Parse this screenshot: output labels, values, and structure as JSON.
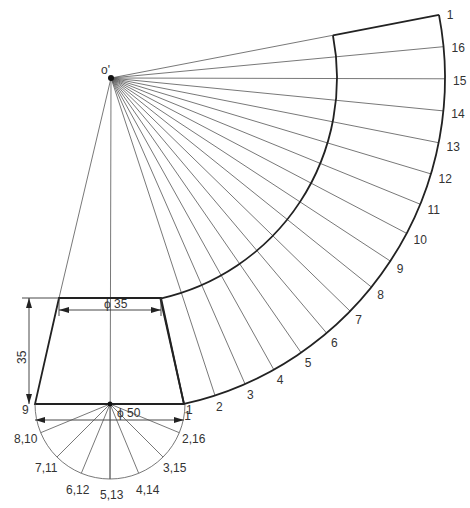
{
  "diagram": {
    "apex_label": "o'",
    "dimensions": {
      "top_diameter": "ϕ 35",
      "bottom_diameter": "ϕ 50",
      "height": "35"
    },
    "base_view_labels": [
      "9",
      "1",
      "8,10",
      "2,16",
      "7,11",
      "3,15",
      "6,12",
      "4,14",
      "5,13"
    ],
    "development_labels": [
      "1",
      "2",
      "3",
      "4",
      "5",
      "6",
      "7",
      "8",
      "9",
      "10",
      "11",
      "12",
      "13",
      "14",
      "15",
      "16",
      "1"
    ],
    "colors": {
      "line": "#333333",
      "background": "#ffffff"
    }
  }
}
